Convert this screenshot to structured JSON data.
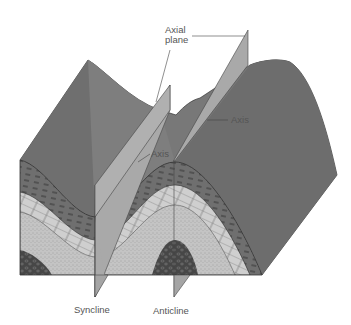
{
  "diagram": {
    "labels": {
      "axial_plane_line1": "Axial",
      "axial_plane_line2": "plane",
      "axis_right": "Axis",
      "axis_left": "Axis",
      "syncline": "Syncline",
      "anticline": "Anticline"
    },
    "layers": [
      {
        "name": "shale-top",
        "pattern": "dashes",
        "color": "#6e6e6e"
      },
      {
        "name": "limestone",
        "pattern": "bricks",
        "color": "#c9c9c9"
      },
      {
        "name": "sandstone",
        "pattern": "stipple",
        "color": "#bdbdbd"
      },
      {
        "name": "conglomerate",
        "pattern": "pebbles",
        "color": "#4a4a4a"
      }
    ],
    "colors": {
      "top_surface": "#7a7a7a",
      "side_surface": "#6a6a6a",
      "axial_plane": "#a8a8a8",
      "outline": "#333333"
    }
  }
}
